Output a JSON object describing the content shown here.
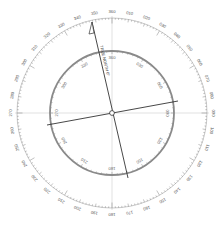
{
  "diagram": {
    "type": "compass-rose-protractor",
    "center": [
      112,
      113
    ],
    "colors": {
      "background": "#ffffff",
      "outer_ticks": "#777777",
      "inner_ring": "#8a8a8a",
      "crosshair": "#cccccc",
      "bearing_line": "#333333",
      "arrow_line": "#333333"
    },
    "outer_scale": {
      "label_radius": 101,
      "tick_outer_radius": 95,
      "labels": [
        "010",
        "020",
        "030",
        "040",
        "050",
        "060",
        "070",
        "080",
        "090",
        "100",
        "110",
        "120",
        "130",
        "140",
        "150",
        "160",
        "170",
        "180",
        "190",
        "200",
        "210",
        "220",
        "230",
        "240",
        "250",
        "260",
        "270",
        "280",
        "290",
        "300",
        "310",
        "320",
        "330",
        "340",
        "350",
        "360"
      ]
    },
    "inner_scale": {
      "radius": 62,
      "labels": [
        "030",
        "060",
        "090",
        "120",
        "150",
        "180",
        "210",
        "240",
        "270",
        "300",
        "330",
        "360"
      ]
    },
    "bearing_line": {
      "from": [
        47,
        125
      ],
      "to": [
        178,
        101
      ]
    },
    "arrow_line": {
      "from": [
        92,
        22
      ],
      "to": [
        128,
        178
      ],
      "caption": "TRUE NORTH 0°"
    }
  }
}
